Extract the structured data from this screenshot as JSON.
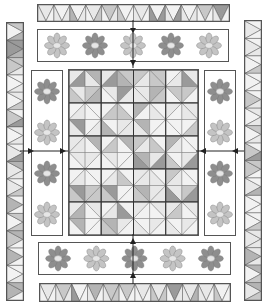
{
  "diagram": {
    "colors": {
      "outline": "#555555",
      "light": "#e8e8e8",
      "mid": "#c8c8c8",
      "dark": "#9a9a9a",
      "flower_light_petal": "#c4c4c4",
      "flower_dark_petal": "#8e8e8e",
      "flower_center": "#e6e6e6"
    },
    "pieces": [
      {
        "name": "top-pieced-border",
        "type": "triangle-strip"
      },
      {
        "name": "top-flower-border",
        "type": "flower-strip",
        "flowers": 5
      },
      {
        "name": "left-flower-border",
        "type": "flower-strip",
        "flowers": 4
      },
      {
        "name": "center-quilt-grid",
        "type": "block-grid",
        "columns": 4,
        "rows": 5
      },
      {
        "name": "right-flower-border",
        "type": "flower-strip",
        "flowers": 4
      },
      {
        "name": "bottom-flower-border",
        "type": "flower-strip",
        "flowers": 5
      },
      {
        "name": "bottom-pieced-border",
        "type": "triangle-strip"
      },
      {
        "name": "left-pieced-border",
        "type": "triangle-strip"
      },
      {
        "name": "right-pieced-border",
        "type": "triangle-strip"
      }
    ],
    "arrows": [
      {
        "name": "arrow-top-down",
        "direction": "down"
      },
      {
        "name": "arrow-bottom-up",
        "direction": "up"
      },
      {
        "name": "arrow-left-right",
        "direction": "right"
      },
      {
        "name": "arrow-right-left",
        "direction": "left"
      }
    ]
  }
}
